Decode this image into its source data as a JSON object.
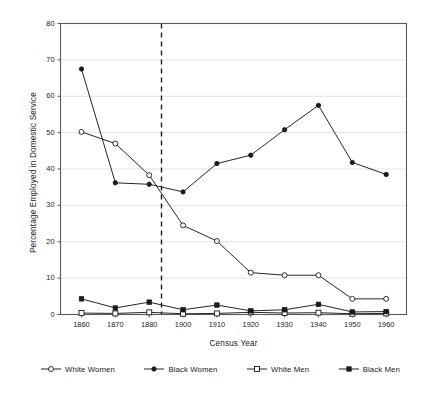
{
  "chart_data": {
    "type": "line",
    "title": "",
    "xlabel": "Census Year",
    "ylabel": "Percentage Employed in Domestic Service",
    "categories": [
      "1860",
      "1870",
      "1880",
      "1900",
      "1910",
      "1920",
      "1930",
      "1940",
      "1950",
      "1960"
    ],
    "ylim": [
      0,
      80
    ],
    "ytick_values": [
      "0",
      "10",
      "20",
      "30",
      "40",
      "50",
      "60",
      "70",
      "80"
    ],
    "grid": "horizontal",
    "legend_position": "bottom",
    "series": [
      {
        "name": "White Women",
        "marker": "open-circle",
        "values": [
          50.2,
          47.0,
          38.3,
          24.5,
          20.2,
          11.5,
          10.8,
          10.8,
          4.3,
          4.3
        ]
      },
      {
        "name": "Black Women",
        "marker": "filled-circle",
        "values": [
          67.5,
          36.2,
          35.8,
          33.7,
          41.5,
          43.8,
          50.8,
          57.5,
          41.8,
          38.5
        ]
      },
      {
        "name": "White Men",
        "marker": "open-square",
        "values": [
          0.4,
          0.3,
          0.6,
          0.2,
          0.3,
          0.6,
          0.4,
          0.5,
          0.2,
          0.3
        ]
      },
      {
        "name": "Black Men",
        "marker": "filled-square",
        "values": [
          4.3,
          1.8,
          3.4,
          1.3,
          2.6,
          1.0,
          1.3,
          2.8,
          0.7,
          0.8
        ]
      }
    ],
    "annotations": [
      {
        "type": "vertical-dashed-line",
        "x_position": 0.29,
        "label": ""
      }
    ],
    "colors": {
      "line": "#1a1a1a",
      "grid": "#e4e4e4",
      "frame": "#5a5a5a",
      "background": "#ffffff"
    }
  }
}
